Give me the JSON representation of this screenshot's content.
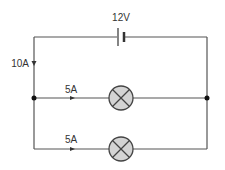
{
  "diagram": {
    "type": "parallel-circuit",
    "colors": {
      "wire": "#555555",
      "lamp_fill": "#d4d4d4",
      "lamp_stroke": "#444444",
      "node": "#111111",
      "text": "#333333"
    },
    "battery": {
      "label": "12V"
    },
    "main_current": {
      "label": "10A",
      "direction": "down"
    },
    "branches": [
      {
        "current_label": "5A",
        "component": "lamp",
        "direction": "right"
      },
      {
        "current_label": "5A",
        "component": "lamp",
        "direction": "right"
      }
    ]
  }
}
